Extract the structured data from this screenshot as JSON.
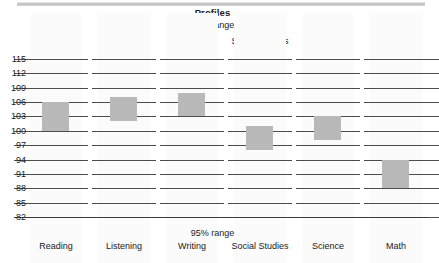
{
  "chart": {
    "title": "Profiles",
    "range_label_top": "68% range",
    "range_label_bottom": "95% range"
  },
  "chart_data": {
    "type": "bar",
    "title": "Profiles",
    "subtitle": "68% range",
    "xlabel": "",
    "ylabel": "",
    "ylim": [
      82,
      115
    ],
    "ytick_step": 3,
    "grid": true,
    "legend": false,
    "categories": [
      "Reading",
      "Listening",
      "Writing",
      "Social Studies",
      "Science",
      "Math"
    ],
    "yticks": [
      "115",
      "112",
      "109",
      "106",
      "103",
      "100",
      "97",
      "94",
      "91",
      "88",
      "85",
      "82"
    ],
    "ranges": [
      {
        "category": "Reading",
        "low": 100,
        "high": 106,
        "center": 103
      },
      {
        "category": "Listening",
        "low": 102,
        "high": 107,
        "center": 104.5
      },
      {
        "category": "Writing",
        "low": 103,
        "high": 108,
        "center": 105.5
      },
      {
        "category": "Social Studies",
        "low": 96,
        "high": 101,
        "center": 98.5
      },
      {
        "category": "Science",
        "low": 98,
        "high": 103,
        "center": 100.5
      },
      {
        "category": "Math",
        "low": 88,
        "high": 94,
        "center": 91
      }
    ],
    "bar_color": "#b9b9b9",
    "gridline_color": "#4d4d4d",
    "panels": [
      {
        "label": "68% range",
        "position": "top"
      },
      {
        "label": "95% range",
        "position": "bottom"
      }
    ]
  }
}
